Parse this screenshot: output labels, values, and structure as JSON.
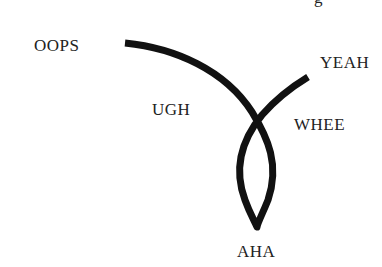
{
  "diagram": {
    "type": "curve-with-labels",
    "stroke_color": "#111111",
    "label_color": "#222222",
    "labels": {
      "oops": "OOPS",
      "yeah": "YEAH",
      "ugh": "UGH",
      "whee": "WHEE",
      "aha": "AHA"
    },
    "clipped_top_text": "g"
  }
}
